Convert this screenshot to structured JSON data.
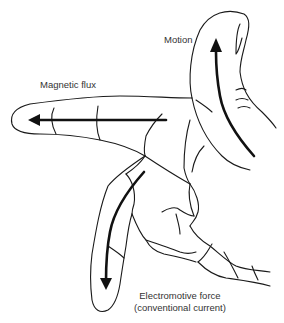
{
  "diagram": {
    "labels": {
      "motion": "Motion",
      "magnetic_flux": "Magnetic flux",
      "emf_line1": "Electromotive force",
      "emf_line2": "(conventional current)"
    },
    "arrows": [
      {
        "name": "motion",
        "finger": "thumb",
        "direction": "up"
      },
      {
        "name": "magnetic_flux",
        "finger": "index finger",
        "direction": "left"
      },
      {
        "name": "electromotive_force",
        "finger": "middle finger",
        "direction": "down"
      }
    ],
    "colors": {
      "line": "#1a1a1a",
      "arrow": "#111111",
      "text": "#333333",
      "background": "#ffffff"
    }
  }
}
